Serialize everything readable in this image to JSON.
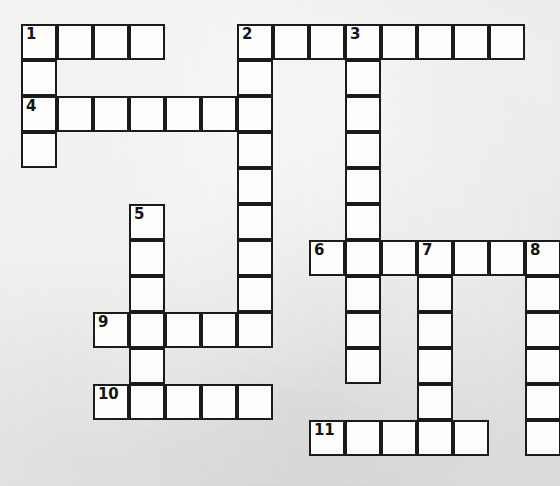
{
  "puzzle": {
    "type": "crossword-grid",
    "title": "Crossword Puzzle Grid",
    "geometry": {
      "origin_x": 21,
      "origin_y": 24,
      "cell_size": 36,
      "columns": 15,
      "rows": 12
    },
    "colors": {
      "cell_fill": "#fdfdfc",
      "cell_border": "#1b1b1b",
      "paper_background": "#e8e8e6",
      "number_text": "#141414"
    },
    "entries": [
      {
        "number": "1",
        "direction": "across",
        "row": 0,
        "col": 0,
        "length": 4
      },
      {
        "number": "1",
        "direction": "down",
        "row": 0,
        "col": 0,
        "length": 4
      },
      {
        "number": "2",
        "direction": "across",
        "row": 0,
        "col": 6,
        "length": 8
      },
      {
        "number": "2",
        "direction": "down",
        "row": 0,
        "col": 6,
        "length": 9
      },
      {
        "number": "3",
        "direction": "down",
        "row": 0,
        "col": 9,
        "length": 6
      },
      {
        "number": "4",
        "direction": "across",
        "row": 2,
        "col": 0,
        "length": 7
      },
      {
        "number": "5",
        "direction": "down",
        "row": 5,
        "col": 3,
        "length": 6
      },
      {
        "number": "6",
        "direction": "across",
        "row": 6,
        "col": 8,
        "length": 7
      },
      {
        "number": "6",
        "direction": "down",
        "row": 6,
        "col": 9,
        "length": 4
      },
      {
        "number": "7",
        "direction": "down",
        "row": 6,
        "col": 11,
        "length": 6
      },
      {
        "number": "8",
        "direction": "down",
        "row": 6,
        "col": 14,
        "length": 6
      },
      {
        "number": "9",
        "direction": "across",
        "row": 8,
        "col": 2,
        "length": 5
      },
      {
        "number": "10",
        "direction": "across",
        "row": 10,
        "col": 2,
        "length": 5
      },
      {
        "number": "11",
        "direction": "across",
        "row": 11,
        "col": 8,
        "length": 5
      }
    ],
    "cells": [
      {
        "row": 0,
        "col": 0,
        "number": "1"
      },
      {
        "row": 0,
        "col": 1,
        "number": ""
      },
      {
        "row": 0,
        "col": 2,
        "number": ""
      },
      {
        "row": 0,
        "col": 3,
        "number": ""
      },
      {
        "row": 0,
        "col": 6,
        "number": "2"
      },
      {
        "row": 0,
        "col": 7,
        "number": ""
      },
      {
        "row": 0,
        "col": 8,
        "number": ""
      },
      {
        "row": 0,
        "col": 9,
        "number": "3"
      },
      {
        "row": 0,
        "col": 10,
        "number": ""
      },
      {
        "row": 0,
        "col": 11,
        "number": ""
      },
      {
        "row": 0,
        "col": 12,
        "number": ""
      },
      {
        "row": 0,
        "col": 13,
        "number": ""
      },
      {
        "row": 1,
        "col": 0,
        "number": ""
      },
      {
        "row": 1,
        "col": 6,
        "number": ""
      },
      {
        "row": 1,
        "col": 9,
        "number": ""
      },
      {
        "row": 2,
        "col": 0,
        "number": "4"
      },
      {
        "row": 2,
        "col": 1,
        "number": ""
      },
      {
        "row": 2,
        "col": 2,
        "number": ""
      },
      {
        "row": 2,
        "col": 3,
        "number": ""
      },
      {
        "row": 2,
        "col": 4,
        "number": ""
      },
      {
        "row": 2,
        "col": 5,
        "number": ""
      },
      {
        "row": 2,
        "col": 6,
        "number": ""
      },
      {
        "row": 2,
        "col": 9,
        "number": ""
      },
      {
        "row": 3,
        "col": 0,
        "number": ""
      },
      {
        "row": 3,
        "col": 6,
        "number": ""
      },
      {
        "row": 3,
        "col": 9,
        "number": ""
      },
      {
        "row": 4,
        "col": 6,
        "number": ""
      },
      {
        "row": 4,
        "col": 9,
        "number": ""
      },
      {
        "row": 5,
        "col": 3,
        "number": "5"
      },
      {
        "row": 5,
        "col": 6,
        "number": ""
      },
      {
        "row": 5,
        "col": 9,
        "number": ""
      },
      {
        "row": 6,
        "col": 3,
        "number": ""
      },
      {
        "row": 6,
        "col": 6,
        "number": ""
      },
      {
        "row": 6,
        "col": 8,
        "number": "6"
      },
      {
        "row": 6,
        "col": 9,
        "number": ""
      },
      {
        "row": 6,
        "col": 10,
        "number": ""
      },
      {
        "row": 6,
        "col": 11,
        "number": "7"
      },
      {
        "row": 6,
        "col": 12,
        "number": ""
      },
      {
        "row": 6,
        "col": 13,
        "number": ""
      },
      {
        "row": 6,
        "col": 14,
        "number": "8"
      },
      {
        "row": 7,
        "col": 3,
        "number": ""
      },
      {
        "row": 7,
        "col": 6,
        "number": ""
      },
      {
        "row": 7,
        "col": 9,
        "number": ""
      },
      {
        "row": 7,
        "col": 11,
        "number": ""
      },
      {
        "row": 7,
        "col": 14,
        "number": ""
      },
      {
        "row": 8,
        "col": 2,
        "number": "9"
      },
      {
        "row": 8,
        "col": 3,
        "number": ""
      },
      {
        "row": 8,
        "col": 4,
        "number": ""
      },
      {
        "row": 8,
        "col": 5,
        "number": ""
      },
      {
        "row": 8,
        "col": 6,
        "number": ""
      },
      {
        "row": 8,
        "col": 9,
        "number": ""
      },
      {
        "row": 8,
        "col": 11,
        "number": ""
      },
      {
        "row": 8,
        "col": 14,
        "number": ""
      },
      {
        "row": 9,
        "col": 3,
        "number": ""
      },
      {
        "row": 9,
        "col": 9,
        "number": ""
      },
      {
        "row": 9,
        "col": 11,
        "number": ""
      },
      {
        "row": 9,
        "col": 14,
        "number": ""
      },
      {
        "row": 10,
        "col": 2,
        "number": "10"
      },
      {
        "row": 10,
        "col": 3,
        "number": ""
      },
      {
        "row": 10,
        "col": 4,
        "number": ""
      },
      {
        "row": 10,
        "col": 5,
        "number": ""
      },
      {
        "row": 10,
        "col": 6,
        "number": ""
      },
      {
        "row": 10,
        "col": 11,
        "number": ""
      },
      {
        "row": 10,
        "col": 14,
        "number": ""
      },
      {
        "row": 11,
        "col": 8,
        "number": "11"
      },
      {
        "row": 11,
        "col": 9,
        "number": ""
      },
      {
        "row": 11,
        "col": 10,
        "number": ""
      },
      {
        "row": 11,
        "col": 11,
        "number": ""
      },
      {
        "row": 11,
        "col": 12,
        "number": ""
      },
      {
        "row": 11,
        "col": 14,
        "number": ""
      }
    ]
  }
}
